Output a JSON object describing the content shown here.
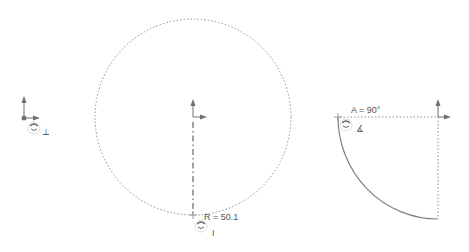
{
  "canvas": {
    "background": "#ffffff",
    "line_color": "#808080",
    "dim_color": "#555555"
  },
  "sketches": [
    {
      "id": "origin-only",
      "label": ""
    },
    {
      "id": "circle",
      "dimension_label": "R = 50.1"
    },
    {
      "id": "quarter-arc",
      "dimension_label": "A = 90°"
    }
  ],
  "labels": {
    "radius": "R = 50.1",
    "angle": "A = 90°",
    "vertical_marker": "I",
    "angle_symbol": "∡",
    "perpendicular_symbol": "⟂"
  },
  "icons": {
    "origin": "origin-axes-icon",
    "rotate_cursor": "rotate-cursor-icon",
    "relation": "sketch-relation-icon"
  }
}
